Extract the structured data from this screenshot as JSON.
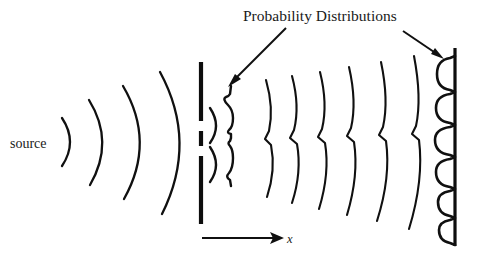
{
  "figure": {
    "type": "double-slit-diffraction-diagram",
    "title": "Probability Distributions",
    "background_color": "#ffffff",
    "ink_color": "#101010",
    "width": 479,
    "height": 263
  },
  "labels": {
    "title": "Probability Distributions",
    "source": "source",
    "axis_x": "x"
  },
  "annotations": {
    "pointer_left": {
      "name": "arrow-to-near-distribution",
      "from_x": 285,
      "from_y": 30,
      "to_x": 229,
      "to_y": 86
    },
    "pointer_right": {
      "name": "arrow-to-screen-distribution",
      "from_x": 404,
      "from_y": 32,
      "to_x": 442,
      "to_y": 58
    }
  },
  "source_waves": {
    "name": "spherical-wavefronts-from-source",
    "origin_x": 46,
    "origin_y": 142,
    "count": 4,
    "radii": [
      28,
      58,
      92,
      128
    ],
    "angular_half_spread_deg": [
      62,
      66,
      70,
      72
    ]
  },
  "barrier": {
    "name": "double-slit-barrier",
    "x": 201,
    "top_y": 62,
    "bottom_y": 224,
    "slit_count": 2,
    "segments": [
      {
        "y1": 62,
        "y2": 121
      },
      {
        "y1": 131,
        "y2": 146
      },
      {
        "y1": 156,
        "y2": 224
      }
    ],
    "slits": [
      {
        "center_y": 126,
        "gap": 10
      },
      {
        "center_y": 151,
        "gap": 10
      }
    ]
  },
  "slit_waves": {
    "name": "interference-wavefronts-after-slits",
    "count": 6,
    "x_positions": [
      268,
      292,
      318,
      346,
      378,
      412
    ],
    "top_y": [
      78,
      74,
      70,
      66,
      62,
      58
    ],
    "bottom_y": [
      196,
      202,
      208,
      214,
      220,
      228
    ],
    "kink_y": 139
  },
  "near_distribution": {
    "name": "two-peak-probability-distribution",
    "baseline_x": 227,
    "peak_count": 2,
    "peaks": [
      {
        "center_y": 110,
        "amplitude": 22
      },
      {
        "center_y": 160,
        "amplitude": 22
      }
    ],
    "top_y": 86,
    "bottom_y": 186
  },
  "screen": {
    "name": "detector-screen",
    "x": 455,
    "top_y": 48,
    "bottom_y": 246,
    "fringe_count": 6,
    "fringes": [
      {
        "center_y": 74,
        "amplitude": 17
      },
      {
        "center_y": 106,
        "amplitude": 18
      },
      {
        "center_y": 138,
        "amplitude": 19
      },
      {
        "center_y": 170,
        "amplitude": 18
      },
      {
        "center_y": 200,
        "amplitude": 16
      },
      {
        "center_y": 228,
        "amplitude": 15
      }
    ]
  },
  "axis": {
    "name": "x-axis-arrow",
    "start_x": 202,
    "end_x": 282,
    "y": 238,
    "label": "x",
    "label_x": 288,
    "label_y": 243
  }
}
